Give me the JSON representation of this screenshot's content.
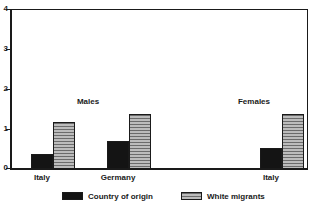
{
  "chart_data": {
    "type": "bar",
    "title": "",
    "subtitle": "",
    "xlabel": "",
    "ylabel": "",
    "ylim": [
      0,
      4
    ],
    "yticks": [
      "0",
      "1",
      "2",
      "3",
      "4"
    ],
    "grid": false,
    "legend_position": "bottom",
    "panels": [
      {
        "label": "Males",
        "categories": [
          "Italy",
          "Germany"
        ]
      },
      {
        "label": "Females",
        "categories": [
          "Italy"
        ]
      }
    ],
    "categories": [
      "Italy",
      "Germany",
      "Italy"
    ],
    "series": [
      {
        "name": "Country of origin",
        "color": "#141414",
        "values": [
          0.37,
          0.7,
          0.53
        ]
      },
      {
        "name": "White migrants",
        "color": "#9a9a9a",
        "values": [
          1.17,
          1.38,
          1.38
        ]
      }
    ],
    "legend": [
      "Country of origin",
      "White migrants"
    ]
  },
  "axis": {
    "y": {
      "ticks": [
        {
          "label": "4",
          "value": 4
        },
        {
          "label": "3",
          "value": 3
        },
        {
          "label": "2",
          "value": 2
        },
        {
          "label": "1",
          "value": 1
        },
        {
          "label": "0",
          "value": 0
        }
      ]
    }
  },
  "panels": {
    "males": {
      "label": "Males"
    },
    "females": {
      "label": "Females"
    }
  },
  "categories": {
    "males_italy": "Italy",
    "males_germany": "Germany",
    "females_italy": "Italy"
  },
  "legend": {
    "origin": "Country of origin",
    "migrants": "White migrants"
  }
}
